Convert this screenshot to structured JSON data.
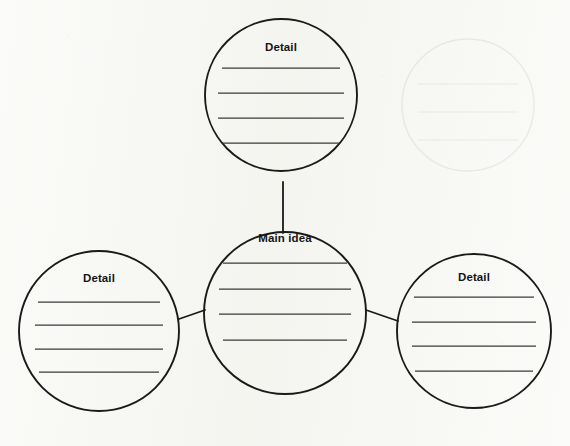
{
  "worksheet": {
    "type": "graphic-organizer",
    "layout": "main-idea-web",
    "page_background": "#fbfbf9",
    "ink_color": "#1a1a1a",
    "rule_color": "#3a3a3a"
  },
  "nodes": [
    {
      "id": "detail-top",
      "label": "Detail",
      "role": "detail",
      "cx": 281,
      "cy": 95,
      "r": 76,
      "label_y": 41,
      "rule_lines": 4,
      "rule_ys": [
        68,
        93,
        118,
        143
      ],
      "rule_half_widths": [
        59,
        63,
        63,
        58
      ]
    },
    {
      "id": "main-idea",
      "label": "Main idea",
      "role": "main",
      "cx": 285,
      "cy": 313,
      "r": 81,
      "label_y": 232,
      "rule_lines": 4,
      "rule_ys": [
        263,
        289,
        314,
        340
      ],
      "rule_half_widths": [
        62,
        66,
        66,
        62
      ]
    },
    {
      "id": "detail-left",
      "label": "Detail",
      "role": "detail",
      "cx": 99,
      "cy": 331,
      "r": 80,
      "label_y": 272,
      "rule_lines": 4,
      "rule_ys": [
        302,
        325,
        349,
        372
      ],
      "rule_half_widths": [
        61,
        64,
        64,
        60
      ]
    },
    {
      "id": "detail-right",
      "label": "Detail",
      "role": "detail",
      "cx": 474,
      "cy": 331,
      "r": 77,
      "label_y": 271,
      "rule_lines": 4,
      "rule_ys": [
        297,
        322,
        346,
        371
      ],
      "rule_half_widths": [
        60,
        62,
        62,
        59
      ]
    }
  ],
  "connectors": [
    {
      "id": "connector-top",
      "from": "main-idea",
      "to": "detail-top",
      "x1": 283,
      "y1": 182,
      "x2": 283,
      "y2": 233
    },
    {
      "id": "connector-left",
      "from": "main-idea",
      "to": "detail-left",
      "x1": 179,
      "y1": 319,
      "x2": 205,
      "y2": 310
    },
    {
      "id": "connector-right",
      "from": "main-idea",
      "to": "detail-right",
      "x1": 366,
      "y1": 310,
      "x2": 398,
      "y2": 321
    }
  ],
  "ghost_artifact": {
    "description": "faint show-through circle from reverse side of page",
    "cx": 468,
    "cy": 105,
    "r": 66,
    "rule_ys": [
      84,
      112,
      140
    ],
    "rule_half_width": 50
  }
}
